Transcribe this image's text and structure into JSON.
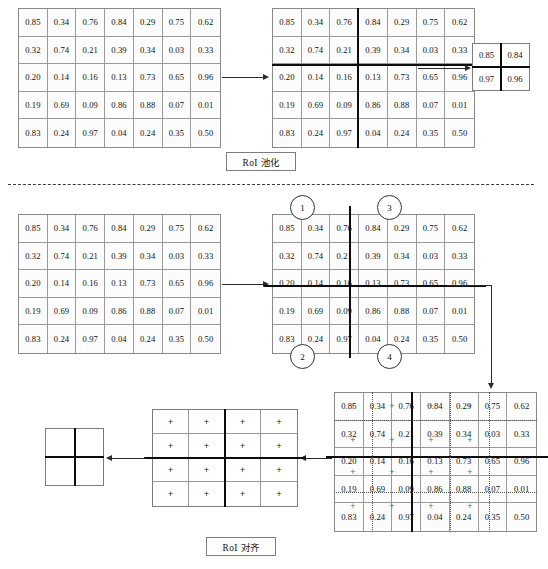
{
  "diagram": {
    "captions": {
      "pooling": "RoI 池化",
      "align": "RoI 对齐"
    },
    "circled_numbers": [
      "1",
      "2",
      "3",
      "4"
    ],
    "plus_marker": "+"
  },
  "feature_map": {
    "rows": 5,
    "cols": 7,
    "values": [
      [
        "0.85",
        "0.34",
        "0.76",
        "0.84",
        "0.29",
        "0.75",
        "0.62"
      ],
      [
        "0.32",
        "0.74",
        "0.21",
        "0.39",
        "0.34",
        "0.03",
        "0.33"
      ],
      [
        "0.20",
        "0.14",
        "0.16",
        "0.13",
        "0.73",
        "0.65",
        "0.96"
      ],
      [
        "0.19",
        "0.69",
        "0.09",
        "0.86",
        "0.88",
        "0.07",
        "0.01"
      ],
      [
        "0.83",
        "0.24",
        "0.97",
        "0.04",
        "0.24",
        "0.35",
        "0.50"
      ]
    ]
  },
  "feature_map_b": {
    "rows": 5,
    "cols": 7,
    "values": [
      [
        "0.85",
        "0.34",
        "0.76",
        "0.84",
        "0.29",
        "0.75",
        "0.62"
      ],
      [
        "0.32",
        "0.74",
        "0.21",
        "0.39",
        "0.34",
        "0.03",
        "0.33"
      ],
      [
        "0.20",
        "0.14",
        "0.16",
        "0.13",
        "0.73",
        "0.65",
        "0.96"
      ],
      [
        "0.19",
        "0.69",
        "0.09",
        "0.86",
        "0.88",
        "0.07",
        "0.01"
      ],
      [
        "0.83",
        "0.24",
        "0.97",
        "0.04",
        "0.24",
        "0.35",
        "0.50"
      ]
    ]
  },
  "feature_map_c": {
    "rows": 5,
    "cols": 7,
    "values": [
      [
        "0.85",
        "0.34",
        "0.76",
        "0.84",
        "0.29",
        "0.75",
        "0.62"
      ],
      [
        "0.32",
        "0.74",
        "0.21",
        "0.39",
        "0.34",
        "0.03",
        "0.33"
      ],
      [
        "0.20",
        "0.14",
        "0.16",
        "0.13",
        "0.73",
        "0.65",
        "0.96"
      ],
      [
        "0.19",
        "0.69",
        "0.09",
        "0.86",
        "0.88",
        "0.07",
        "0.01"
      ],
      [
        "0.83",
        "0.24",
        "0.97",
        "0.04",
        "0.24",
        "0.35",
        "0.50"
      ]
    ]
  },
  "feature_map_d": {
    "rows": 5,
    "cols": 7,
    "values": [
      [
        "0.85",
        "0.34",
        "0.76",
        "0.84",
        "0.29",
        "0.75",
        "0.62"
      ],
      [
        "0.32",
        "0.74",
        "0.21",
        "0.39",
        "0.34",
        "0.03",
        "0.33"
      ],
      [
        "0.20",
        "0.14",
        "0.16",
        "0.13",
        "0.73",
        "0.65",
        "0.96"
      ],
      [
        "0.19",
        "0.69",
        "0.09",
        "0.86",
        "0.88",
        "0.07",
        "0.01"
      ],
      [
        "0.83",
        "0.24",
        "0.97",
        "0.04",
        "0.24",
        "0.35",
        "0.50"
      ]
    ]
  },
  "pooled_output": {
    "rows": 2,
    "cols": 2,
    "values": [
      [
        "0.85",
        "0.84"
      ],
      [
        "0.97",
        "0.96"
      ]
    ]
  },
  "sampling_grid": {
    "rows": 4,
    "cols": 4,
    "values": [
      [
        "+",
        "+",
        "+",
        "+"
      ],
      [
        "+",
        "+",
        "+",
        "+"
      ],
      [
        "+",
        "+",
        "+",
        "+"
      ],
      [
        "+",
        "+",
        "+",
        "+"
      ]
    ]
  },
  "align_output": {
    "rows": 2,
    "cols": 2,
    "values": [
      [
        "",
        ""
      ],
      [
        "",
        ""
      ]
    ]
  },
  "colors": {
    "grid_line": "#9a9a9a",
    "thick_line": "#0d0d0d",
    "arrow": "#2b2b2b",
    "dotted": "#555555"
  }
}
